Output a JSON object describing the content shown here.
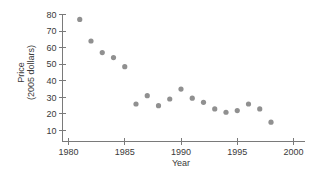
{
  "chart_data": {
    "type": "scatter",
    "title": "",
    "xlabel": "Year",
    "ylabel": "Price (2005 dollars)",
    "ylabel_line1": "Price",
    "ylabel_line2": "(2005 dollars)",
    "xlim": [
      1979,
      2001
    ],
    "ylim": [
      5,
      84
    ],
    "grid": false,
    "legend": "none",
    "marker_color": "#909090",
    "axis_color": "#7a7a7a",
    "text_color": "#3a3a3a",
    "x_ticks": [
      1980,
      1985,
      1990,
      1995,
      2000
    ],
    "x_tick_labels": [
      "1980",
      "1985",
      "1990",
      "1995",
      "2000"
    ],
    "y_ticks": [
      10,
      20,
      30,
      40,
      50,
      60,
      70,
      80
    ],
    "y_tick_labels": [
      "10",
      "20",
      "30",
      "40",
      "50",
      "60",
      "70",
      "80"
    ],
    "x": [
      1981,
      1982,
      1983,
      1984,
      1985,
      1986,
      1987,
      1988,
      1989,
      1990,
      1991,
      1992,
      1993,
      1994,
      1995,
      1996,
      1997,
      1998
    ],
    "values": [
      77,
      64,
      57,
      54,
      48.5,
      26,
      31,
      25,
      29,
      35,
      29.5,
      27,
      23,
      21,
      22,
      26,
      23,
      15
    ],
    "points": [
      {
        "year": 1981,
        "price": 77
      },
      {
        "year": 1982,
        "price": 64
      },
      {
        "year": 1983,
        "price": 57
      },
      {
        "year": 1984,
        "price": 54
      },
      {
        "year": 1985,
        "price": 48.5
      },
      {
        "year": 1986,
        "price": 26
      },
      {
        "year": 1987,
        "price": 31
      },
      {
        "year": 1988,
        "price": 25
      },
      {
        "year": 1989,
        "price": 29
      },
      {
        "year": 1990,
        "price": 35
      },
      {
        "year": 1991,
        "price": 29.5
      },
      {
        "year": 1992,
        "price": 27
      },
      {
        "year": 1993,
        "price": 23
      },
      {
        "year": 1994,
        "price": 21
      },
      {
        "year": 1995,
        "price": 22
      },
      {
        "year": 1996,
        "price": 26
      },
      {
        "year": 1997,
        "price": 23
      },
      {
        "year": 1998,
        "price": 15
      }
    ]
  }
}
